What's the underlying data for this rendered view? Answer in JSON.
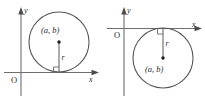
{
  "figure": {
    "colors": {
      "background": "#ffffff",
      "axis": "#6f6f6f",
      "circle": "#565656",
      "radius": "#5a5a5a",
      "label": "#2b2b2b",
      "center_dot": "#1c1c1c"
    },
    "panels": [
      {
        "id": "left",
        "name": "circle-above-x-axis",
        "axes": {
          "y_label": "y",
          "x_label": "x",
          "origin_label": "O"
        },
        "circle": {
          "center_label": "(a, b)",
          "radius_label": "r",
          "cx": 59,
          "cy": 42,
          "r": 30,
          "tangent_side": "above"
        },
        "right_angle_marker": true
      },
      {
        "id": "right",
        "name": "circle-below-x-axis",
        "axes": {
          "y_label": "y",
          "x_label": "x",
          "origin_label": "O"
        },
        "circle": {
          "center_label": "(a, b)",
          "radius_label": "r",
          "cx": 60,
          "cy": 58,
          "r": 30,
          "tangent_side": "below"
        },
        "right_angle_marker": true
      }
    ]
  }
}
